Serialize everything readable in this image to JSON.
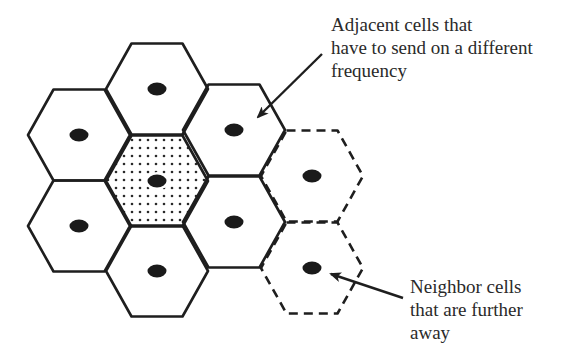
{
  "diagram": {
    "colors": {
      "stroke": "#1e1e1e",
      "antenna": "#1a1a1a",
      "dot_fill": "#2a2a2a",
      "background": "#ffffff",
      "text": "#2a2a2a"
    },
    "hexagon": {
      "half_width": 51,
      "half_height": 45.5
    },
    "cells": [
      {
        "id": "left-upper",
        "cx": 79,
        "cy": 135,
        "type": "adjacent",
        "border": "solid"
      },
      {
        "id": "left-lower",
        "cx": 79,
        "cy": 226,
        "type": "adjacent",
        "border": "solid"
      },
      {
        "id": "top",
        "cx": 157,
        "cy": 89,
        "type": "adjacent",
        "border": "solid"
      },
      {
        "id": "center",
        "cx": 157,
        "cy": 181,
        "type": "center",
        "border": "solid",
        "fill": "dotted"
      },
      {
        "id": "bottom",
        "cx": 157,
        "cy": 271,
        "type": "adjacent",
        "border": "solid"
      },
      {
        "id": "right-upper",
        "cx": 234,
        "cy": 130,
        "type": "adjacent",
        "border": "solid"
      },
      {
        "id": "right-lower",
        "cx": 234,
        "cy": 222,
        "type": "adjacent",
        "border": "solid"
      },
      {
        "id": "far-upper",
        "cx": 312,
        "cy": 176,
        "type": "neighbor",
        "border": "dashed"
      },
      {
        "id": "far-lower",
        "cx": 312,
        "cy": 268,
        "type": "neighbor",
        "border": "dashed"
      }
    ],
    "annotations": [
      {
        "id": "adjacent",
        "lines": [
          "Adjacent cells that",
          "have to send on a different",
          "frequency"
        ],
        "arrow": {
          "x1": 322,
          "y1": 54,
          "x2": 258,
          "y2": 117
        }
      },
      {
        "id": "neighbor",
        "lines": [
          "Neighbor cells",
          "that are further",
          "away"
        ],
        "arrow": {
          "x1": 403,
          "y1": 298,
          "x2": 331,
          "y2": 274
        }
      }
    ]
  }
}
